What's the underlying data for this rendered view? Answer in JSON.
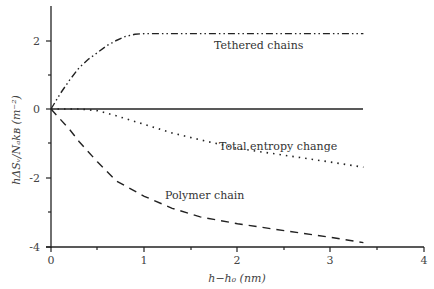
{
  "chart_data": {
    "type": "line",
    "title": "",
    "xlabel": "h−h₀ (nm)",
    "ylabel": "hΔSᵥ/Nₐkʙ (m⁻²)",
    "xlim": [
      0,
      4
    ],
    "ylim": [
      -4,
      3
    ],
    "x_ticks": [
      "0",
      "1",
      "2",
      "3",
      "4"
    ],
    "y_ticks": [
      "-4",
      "-2",
      "0",
      "2"
    ],
    "grid": false,
    "legend": "inline annotations",
    "series": [
      {
        "name": "Tethered chains",
        "style": "dash-dot-dot",
        "x": [
          0,
          0.1,
          0.2,
          0.3,
          0.4,
          0.5,
          0.6,
          0.7,
          0.8,
          0.9,
          1.0,
          1.5,
          2.0,
          2.5,
          3.0,
          3.35
        ],
        "values": [
          0,
          0.45,
          0.85,
          1.2,
          1.45,
          1.65,
          1.85,
          2.0,
          2.12,
          2.18,
          2.2,
          2.2,
          2.2,
          2.2,
          2.2,
          2.2
        ]
      },
      {
        "name": "Zero line",
        "style": "solid",
        "x": [
          0,
          3.35
        ],
        "values": [
          0,
          0
        ]
      },
      {
        "name": "Total entropy change",
        "style": "dotted",
        "x": [
          0,
          0.3,
          0.5,
          0.7,
          1.0,
          1.3,
          1.6,
          2.0,
          2.5,
          3.0,
          3.35
        ],
        "values": [
          0,
          0,
          -0.05,
          -0.2,
          -0.45,
          -0.7,
          -0.9,
          -1.15,
          -1.35,
          -1.55,
          -1.7
        ]
      },
      {
        "name": "Polymer chain",
        "style": "dashed",
        "x": [
          0,
          0.1,
          0.2,
          0.3,
          0.5,
          0.7,
          1.0,
          1.3,
          1.6,
          2.0,
          2.5,
          3.0,
          3.35
        ],
        "values": [
          0,
          -0.3,
          -0.6,
          -0.95,
          -1.55,
          -2.1,
          -2.55,
          -2.9,
          -3.15,
          -3.35,
          -3.55,
          -3.75,
          -3.9
        ]
      }
    ],
    "annotations": [
      "Tethered chains",
      "Total entropy change",
      "Polymer chain"
    ]
  },
  "labels": {
    "tethered": "Tethered chains",
    "total": "Total entropy change",
    "polymer": "Polymer chain",
    "xlabel": "h−h₀ (nm)",
    "ylabel": "hΔSᵥ/Nₐkʙ (m⁻²)"
  },
  "ticks": {
    "x": [
      "0",
      "1",
      "2",
      "3",
      "4"
    ],
    "y": [
      "2",
      "0",
      "-2",
      "-4"
    ]
  }
}
